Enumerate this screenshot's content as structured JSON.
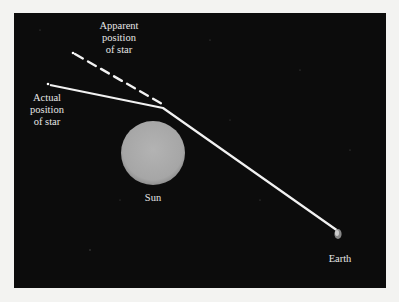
{
  "diagram": {
    "labels": {
      "apparent": [
        "Apparent",
        "position",
        "of star"
      ],
      "actual": [
        "Actual",
        "position",
        "of star"
      ],
      "sun": "Sun",
      "earth": "Earth"
    },
    "colors": {
      "background": "#0c0c0c",
      "frame": "#f3f3f1",
      "sun": "#a9a9a9",
      "light_path": "#f2f2f2",
      "label_text": "#e6e6e6"
    },
    "elements": {
      "actual_star": {
        "x": 49,
        "y": 85
      },
      "apparent_star": {
        "x": 74,
        "y": 53
      },
      "bend_point": {
        "x": 165,
        "y": 108
      },
      "earth": {
        "x": 337,
        "y": 231
      },
      "sun": {
        "cx": 153,
        "cy": 153,
        "r": 32
      }
    }
  }
}
